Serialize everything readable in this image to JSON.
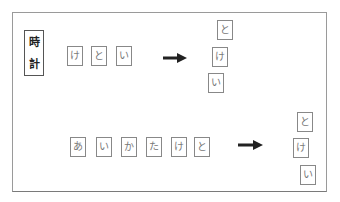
{
  "label": {
    "chars": [
      "時",
      "計"
    ]
  },
  "top_row": {
    "source_tiles": [
      {
        "char": "け"
      },
      {
        "char": "と"
      },
      {
        "char": "い"
      }
    ],
    "arrow": "right-arrow-icon",
    "result_stack": [
      {
        "char": "と"
      },
      {
        "char": "け"
      },
      {
        "char": "い"
      }
    ]
  },
  "bottom_row": {
    "source_tiles": [
      {
        "char": "あ"
      },
      {
        "char": "い"
      },
      {
        "char": "か"
      },
      {
        "char": "た"
      },
      {
        "char": "け"
      },
      {
        "char": "と"
      }
    ],
    "arrow": "right-arrow-icon",
    "result_stack": [
      {
        "char": "と"
      },
      {
        "char": "け"
      },
      {
        "char": "い"
      }
    ]
  },
  "colors": {
    "frame_border": "#9a9a9a",
    "tile_border": "#888888",
    "tile_text": "#777777",
    "label_text": "#222222",
    "arrow": "#222222"
  }
}
